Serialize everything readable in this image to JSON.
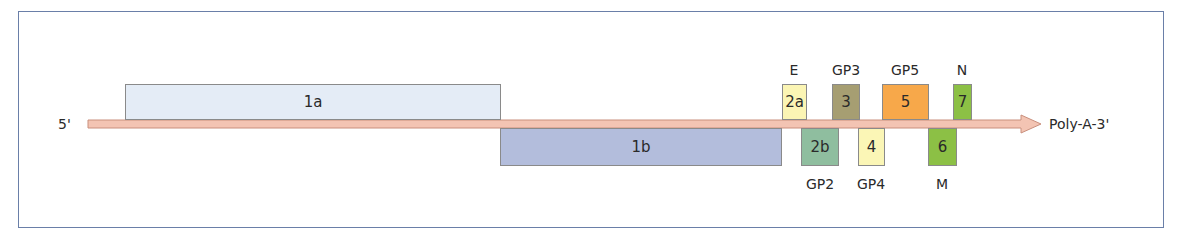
{
  "diagram": {
    "five_prime_label": "5'",
    "three_prime_label": "Poly-A-3'",
    "arrow_color": "#f3c4b3",
    "arrow_stroke": "#c98f7d",
    "orfs": [
      {
        "id": "1a",
        "label": "1a",
        "strand": "top",
        "color": "#e4ecf6",
        "protein": ""
      },
      {
        "id": "1b",
        "label": "1b",
        "strand": "bottom",
        "color": "#b3bddc",
        "protein": ""
      },
      {
        "id": "2a",
        "label": "2a",
        "strand": "top",
        "color": "#fbf5b4",
        "protein": "E"
      },
      {
        "id": "2b",
        "label": "2b",
        "strand": "bottom",
        "color": "#8fbe9f",
        "protein": "GP2"
      },
      {
        "id": "3",
        "label": "3",
        "strand": "top",
        "color": "#a69e72",
        "protein": "GP3"
      },
      {
        "id": "4",
        "label": "4",
        "strand": "bottom",
        "color": "#fbf6b6",
        "protein": "GP4"
      },
      {
        "id": "5",
        "label": "5",
        "strand": "top",
        "color": "#f7a84a",
        "protein": "GP5"
      },
      {
        "id": "6",
        "label": "6",
        "strand": "bottom",
        "color": "#8cc045",
        "protein": "M"
      },
      {
        "id": "7",
        "label": "7",
        "strand": "top",
        "color": "#8cc045",
        "protein": "N"
      }
    ]
  }
}
